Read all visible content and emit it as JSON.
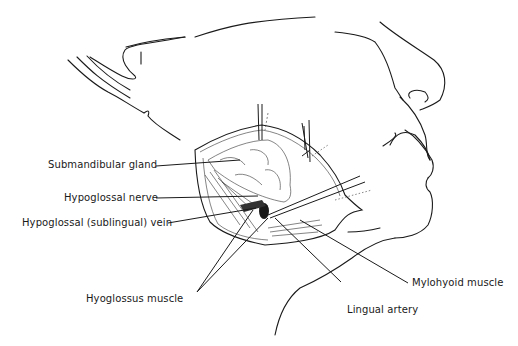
{
  "figure": {
    "labels": [
      {
        "id": "submandibular-gland",
        "text": "Submandibular gland"
      },
      {
        "id": "hypoglossal-nerve",
        "text": "Hypoglossal nerve"
      },
      {
        "id": "hypoglossal-vein",
        "text": "Hypoglossal (sublingual) vein"
      },
      {
        "id": "hyoglossus-muscle",
        "text": "Hyoglossus muscle"
      },
      {
        "id": "lingual-artery",
        "text": "Lingual artery"
      },
      {
        "id": "mylohyoid-muscle",
        "text": "Mylohyoid muscle"
      }
    ]
  }
}
